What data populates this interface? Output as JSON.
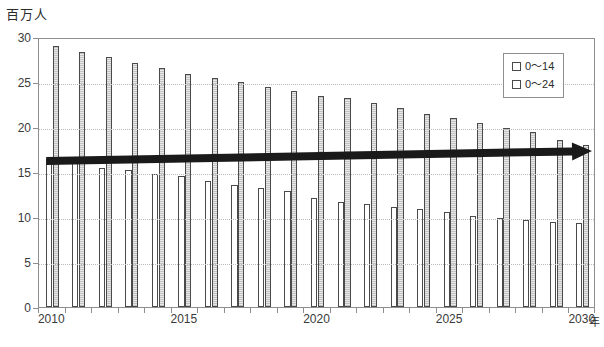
{
  "chart_data": {
    "type": "bar",
    "title": "",
    "unit_label": "百万人",
    "xlabel": "年",
    "ylabel": "",
    "ylim": [
      0,
      30
    ],
    "yticks": [
      0,
      5,
      10,
      15,
      20,
      25,
      30
    ],
    "xticks": [
      "2010",
      "2015",
      "2020",
      "2025",
      "2030"
    ],
    "grid": true,
    "legend_position": "top-right",
    "categories": [
      "2010",
      "2011",
      "2012",
      "2013",
      "2014",
      "2015",
      "2016",
      "2017",
      "2018",
      "2019",
      "2020",
      "2021",
      "2022",
      "2023",
      "2024",
      "2025",
      "2026",
      "2027",
      "2028",
      "2029",
      "2030"
    ],
    "series": [
      {
        "name": "0〜14",
        "color": "#ffffff",
        "values": [
          16.5,
          16.1,
          15.4,
          15.2,
          14.8,
          14.6,
          14.0,
          13.6,
          13.2,
          12.9,
          12.1,
          11.7,
          11.4,
          11.1,
          10.9,
          10.6,
          10.1,
          9.9,
          9.7,
          9.4,
          9.3
        ]
      },
      {
        "name": "0〜24",
        "color": "#e8e8e8",
        "values": [
          29.0,
          28.3,
          27.8,
          27.1,
          26.6,
          25.9,
          25.5,
          25.0,
          24.5,
          24.0,
          23.5,
          23.2,
          22.7,
          22.1,
          21.5,
          21.0,
          20.4,
          19.9,
          19.4,
          18.6,
          18.0
        ]
      }
    ],
    "annotations": [
      {
        "name": "trend-arrow",
        "type": "arrow",
        "color": "#1a1a1a",
        "x_start": "2010",
        "x_end": "2030",
        "y_start": 16.4,
        "y_end": 17.5
      }
    ]
  },
  "legend": {
    "entries": [
      {
        "label": "0〜14"
      },
      {
        "label": "0〜24"
      }
    ]
  }
}
